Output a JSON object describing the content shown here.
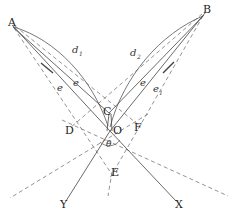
{
  "figure": {
    "canvas": {
      "width": 232,
      "height": 223
    },
    "colors": {
      "solid": "#444444",
      "dashed": "#777777",
      "arc": "#555555",
      "text": "#222222",
      "background": "#ffffff"
    },
    "points": [
      {
        "id": "A",
        "label": "A",
        "x": 12,
        "y": 25,
        "tx": 8,
        "ty": 26
      },
      {
        "id": "B",
        "label": "B",
        "x": 205,
        "y": 12,
        "tx": 203,
        "ty": 13
      },
      {
        "id": "C",
        "label": "C",
        "x": 109,
        "y": 114,
        "tx": 103,
        "ty": 115
      },
      {
        "id": "O",
        "label": "O",
        "x": 110,
        "y": 131,
        "tx": 113,
        "ty": 134
      },
      {
        "id": "D",
        "label": "D",
        "x": 73,
        "y": 131,
        "tx": 65,
        "ty": 134
      },
      {
        "id": "E",
        "label": "E",
        "x": 112,
        "y": 172,
        "tx": 111,
        "ty": 176
      },
      {
        "id": "F",
        "label": "F",
        "x": 136,
        "y": 128,
        "tx": 134,
        "ty": 131
      },
      {
        "id": "X",
        "label": "X",
        "x": 178,
        "y": 204,
        "tx": 175,
        "ty": 208
      },
      {
        "id": "Y",
        "label": "Y",
        "x": 64,
        "y": 204,
        "tx": 60,
        "ty": 208
      }
    ],
    "length_labels": [
      {
        "id": "d1",
        "base": "d",
        "sub": "1",
        "x": 72,
        "y": 53
      },
      {
        "id": "d2",
        "base": "d",
        "sub": "2",
        "x": 130,
        "y": 56
      },
      {
        "id": "e-a-outer",
        "base": "e",
        "sub": "",
        "x": 57,
        "y": 91
      },
      {
        "id": "e-a-inner",
        "base": "e",
        "sub": "",
        "x": 73,
        "y": 86
      },
      {
        "id": "e-b-outer",
        "base": "e",
        "sub": "",
        "x": 140,
        "y": 86
      },
      {
        "id": "e-b-inner",
        "base": "e",
        "sub": "1",
        "x": 153,
        "y": 92
      }
    ],
    "angle_labels": [
      {
        "id": "theta",
        "label": "θ",
        "x": 106,
        "y": 147
      }
    ],
    "lines_solid": [
      {
        "name": "ray-A-to-O",
        "x1": 12,
        "y1": 25,
        "x2": 110,
        "y2": 131
      },
      {
        "name": "ray-A-to-C",
        "x1": 13,
        "y1": 27,
        "x2": 109,
        "y2": 113
      },
      {
        "name": "ray-B-to-O",
        "x1": 205,
        "y1": 13,
        "x2": 110,
        "y2": 131
      },
      {
        "name": "ray-B-to-C",
        "x1": 204,
        "y1": 15,
        "x2": 109,
        "y2": 113
      },
      {
        "name": "line-O-to-X",
        "x1": 110,
        "y1": 131,
        "x2": 176,
        "y2": 201
      },
      {
        "name": "line-O-to-Y",
        "x1": 110,
        "y1": 131,
        "x2": 66,
        "y2": 201
      },
      {
        "name": "seg-C-down-left",
        "x1": 109,
        "y1": 114,
        "x2": 107,
        "y2": 131
      },
      {
        "name": "seg-C-down-right",
        "x1": 111,
        "y1": 114,
        "x2": 112,
        "y2": 131
      }
    ],
    "lines_dashed": [
      {
        "name": "dash-A-to-E",
        "x1": 14,
        "y1": 28,
        "x2": 113,
        "y2": 176
      },
      {
        "name": "dash-A-to-F",
        "x1": 15,
        "y1": 26,
        "x2": 140,
        "y2": 126
      },
      {
        "name": "dash-B-to-E",
        "x1": 203,
        "y1": 16,
        "x2": 110,
        "y2": 178
      },
      {
        "name": "dash-B-to-D",
        "x1": 202,
        "y1": 14,
        "x2": 70,
        "y2": 128
      },
      {
        "name": "dash-D-through-O-right",
        "x1": 62,
        "y1": 120,
        "x2": 228,
        "y2": 196
      },
      {
        "name": "dash-F-through-O-left",
        "x1": 148,
        "y1": 114,
        "x2": 10,
        "y2": 198
      },
      {
        "name": "dash-E-vertical-down",
        "x1": 112,
        "y1": 172,
        "x2": 108,
        "y2": 196
      }
    ],
    "arcs": [
      {
        "name": "arc-d1",
        "d": "M 14 27 C 56 40 92 78 108 126"
      },
      {
        "name": "arc-d2",
        "d": "M 203 16 C 160 34 124 76 110 127"
      }
    ],
    "tick_marks": [
      {
        "name": "tick-e-a",
        "x1": 41,
        "y1": 63,
        "x2": 53,
        "y2": 73
      },
      {
        "name": "tick-e-b",
        "x1": 174,
        "y1": 62,
        "x2": 163,
        "y2": 73
      }
    ],
    "angle_arcs": [
      {
        "name": "angle-theta-arc",
        "d": "M 100 142 A 13 13 0 0 0 120 140"
      }
    ]
  }
}
